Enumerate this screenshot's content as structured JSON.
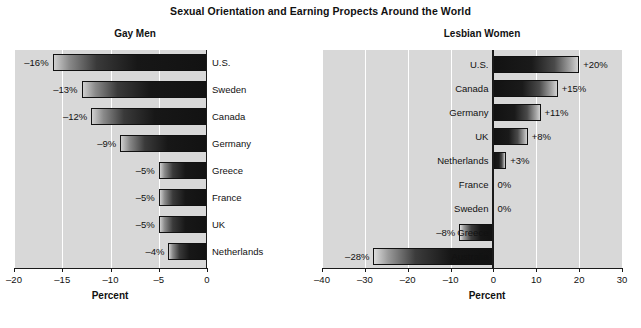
{
  "figure": {
    "title": "Sexual Orientation and Earning Propects Around the World"
  },
  "chart_data": [
    {
      "type": "bar",
      "orientation": "horizontal",
      "title": "Gay Men",
      "xlabel": "Percent",
      "ylabel": "",
      "xlim": [
        -20,
        0
      ],
      "xticks": [
        -20,
        -15,
        -10,
        -5,
        0
      ],
      "xticklabels": [
        "–20",
        "–15",
        "–10",
        "–5",
        "0"
      ],
      "grid": true,
      "grid_color": "#ffffff",
      "plot_background": "#d8d8d8",
      "legend": "none",
      "categories": [
        "U.S.",
        "Sweden",
        "Canada",
        "Germany",
        "Greece",
        "France",
        "UK",
        "Netherlands"
      ],
      "values": [
        -16,
        -13,
        -12,
        -9,
        -5,
        -5,
        -5,
        -4
      ],
      "data_labels": [
        "–16%",
        "–13%",
        "–12%",
        "–9%",
        "–5%",
        "–5%",
        "–5%",
        "–4%"
      ]
    },
    {
      "type": "bar",
      "orientation": "horizontal",
      "title": "Lesbian Women",
      "xlabel": "Percent",
      "ylabel": "",
      "xlim": [
        -40,
        30
      ],
      "xticks": [
        -40,
        -30,
        -20,
        -10,
        0,
        10,
        20,
        30
      ],
      "xticklabels": [
        "–40",
        "–30",
        "–20",
        "–10",
        "0",
        "10",
        "20",
        "30"
      ],
      "grid": true,
      "grid_color": "#ffffff",
      "plot_background": "#d8d8d8",
      "legend": "none",
      "categories": [
        "U.S.",
        "Canada",
        "Germany",
        "UK",
        "Netherlands",
        "France",
        "Sweden",
        "Greece",
        "Australia"
      ],
      "values": [
        20,
        15,
        11,
        8,
        3,
        0,
        0,
        -8,
        -28
      ],
      "data_labels": [
        "+20%",
        "+15%",
        "+11%",
        "+8%",
        "+3%",
        "0%",
        "0%",
        "–8%",
        "–28%"
      ]
    }
  ]
}
